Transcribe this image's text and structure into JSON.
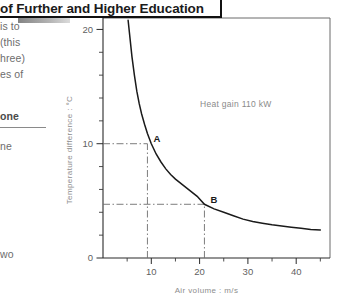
{
  "header": {
    "banner_text": "of Further and Higher Education"
  },
  "left_column": {
    "fragments": [
      {
        "text": "is to",
        "top": 20,
        "bold": false
      },
      {
        "text": "(this",
        "top": 36,
        "bold": false
      },
      {
        "text": "hree)",
        "top": 52,
        "bold": false
      },
      {
        "text": "es of",
        "top": 68,
        "bold": false
      },
      {
        "text": "one",
        "top": 110,
        "bold": true
      },
      {
        "text": "ne",
        "top": 140,
        "bold": false
      },
      {
        "text": "wo",
        "top": 248,
        "bold": false
      }
    ]
  },
  "chart_data": {
    "type": "line",
    "title": "",
    "xlabel": "Air volume : m/s",
    "ylabel": "Temperature difference : °C",
    "xlim": [
      0,
      47
    ],
    "ylim": [
      0,
      21
    ],
    "xticks": [
      10,
      20,
      30,
      40
    ],
    "yticks": [
      0,
      10,
      20
    ],
    "xticklabels": [
      "10",
      "20",
      "30",
      "40"
    ],
    "yticklabels": [
      "0",
      "10",
      "20"
    ],
    "x_minor_step": 5,
    "y_minor_step": 2,
    "grid": false,
    "legend": null,
    "annotations": [
      {
        "text": "Heat gain 110 kW",
        "x": 27.5,
        "y": 13.2
      }
    ],
    "series": [
      {
        "name": "Temperature difference vs air volume",
        "x": [
          5.2,
          5.6,
          6.0,
          6.5,
          7.0,
          7.5,
          8.0,
          8.6,
          9.2,
          10.0,
          11.0,
          12.0,
          13.0,
          14.0,
          15.0,
          16.5,
          18.0,
          19.5,
          21.0,
          23.0,
          25.0,
          27.0,
          29.0,
          31.0,
          33.0,
          35.0,
          37.0,
          39.0,
          41.0,
          43.0,
          45.0
        ],
        "y": [
          20.8,
          19.2,
          17.6,
          16.0,
          14.6,
          13.5,
          12.6,
          11.7,
          10.9,
          10.0,
          9.1,
          8.4,
          7.8,
          7.3,
          6.9,
          6.4,
          5.9,
          5.4,
          4.7,
          4.3,
          4.0,
          3.7,
          3.4,
          3.2,
          3.05,
          2.9,
          2.8,
          2.7,
          2.6,
          2.5,
          2.45
        ]
      }
    ],
    "points": [
      {
        "label": "A",
        "x": 9.2,
        "y": 10.0,
        "guide_x": true,
        "guide_y": true
      },
      {
        "label": "B",
        "x": 21.0,
        "y": 4.7,
        "guide_x": true,
        "guide_y": true
      }
    ]
  }
}
